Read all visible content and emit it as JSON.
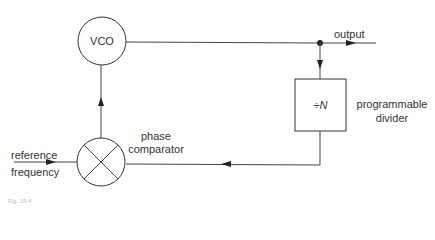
{
  "diagram": {
    "blocks": {
      "vco": {
        "label": "VCO"
      },
      "divider": {
        "label": "÷N",
        "caption_line1": "programmable",
        "caption_line2": "divider"
      },
      "comparator": {
        "caption_line1": "phase",
        "caption_line2": "comparator"
      }
    },
    "signals": {
      "output": "output",
      "reference_line1": "reference",
      "reference_line2": "frequency"
    },
    "caption": "Fig. 15.4"
  }
}
